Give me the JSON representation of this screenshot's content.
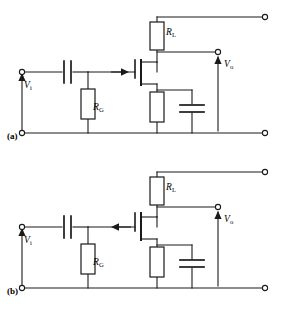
{
  "figure": {
    "panels": [
      {
        "id": "a",
        "caption": "(a)",
        "device": "n-channel-jfet",
        "gate_arrow_direction": "right",
        "labels": {
          "load_resistor": "R",
          "load_resistor_sub": "L",
          "gate_resistor": "R",
          "gate_resistor_sub": "G",
          "input_voltage": "V",
          "input_voltage_sub": "i",
          "output_voltage": "V",
          "output_voltage_sub": "o"
        }
      },
      {
        "id": "b",
        "caption": "(b)",
        "device": "p-channel-jfet",
        "gate_arrow_direction": "left",
        "labels": {
          "load_resistor": "R",
          "load_resistor_sub": "L",
          "gate_resistor": "R",
          "gate_resistor_sub": "G",
          "input_voltage": "V",
          "input_voltage_sub": "i",
          "output_voltage": "V",
          "output_voltage_sub": "o"
        }
      }
    ],
    "colors": {
      "wire": "#1a1a1a",
      "background": "#ffffff",
      "text": "#000000"
    }
  }
}
